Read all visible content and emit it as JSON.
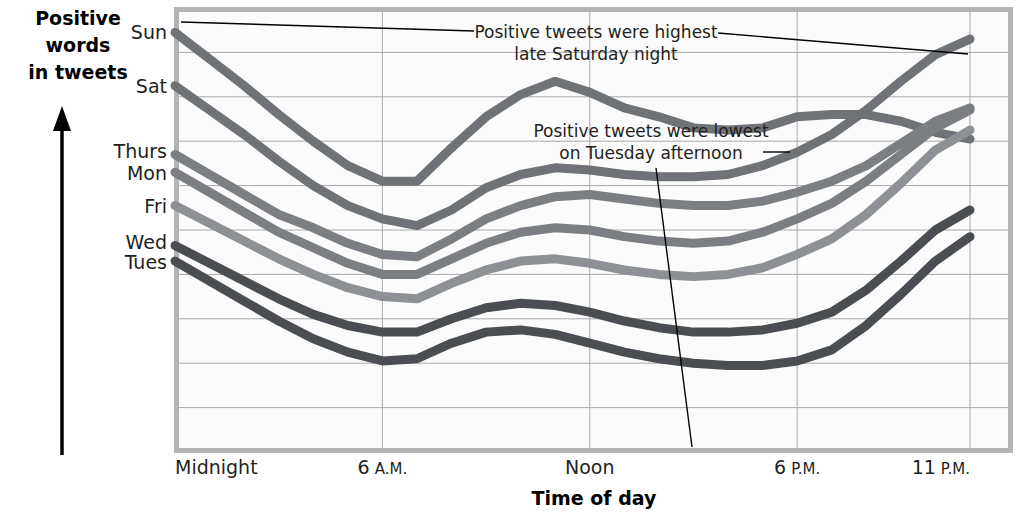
{
  "axes": {
    "y_title_lines": [
      "Positive",
      "words",
      "in tweets"
    ],
    "x_title": "Time of day",
    "y_tick_labels": [
      "Sun",
      "Sat",
      "Thurs",
      "Mon",
      "Fri",
      "Wed",
      "Tues"
    ],
    "x_tick_labels": [
      {
        "main": "Midnight",
        "suffix": ""
      },
      {
        "main": "6",
        "suffix": "A.M."
      },
      {
        "main": "Noon",
        "suffix": ""
      },
      {
        "main": "6",
        "suffix": "P.M."
      },
      {
        "main": "11",
        "suffix": "P.M."
      }
    ]
  },
  "annotations": [
    {
      "id": "highest",
      "lines": [
        "Positive tweets were highest",
        "late Saturday night"
      ]
    },
    {
      "id": "lowest",
      "lines": [
        "Positive tweets were lowest",
        "on Tuesday afternoon"
      ]
    }
  ],
  "chart_data": {
    "type": "line",
    "title": "",
    "xlabel": "Time of day",
    "ylabel": "Positive words in tweets",
    "grid": true,
    "legend": "left-axis-inline-day-labels",
    "xlim": [
      0,
      23
    ],
    "ylim": [
      0,
      10
    ],
    "xtick_values": [
      0,
      6,
      12,
      18,
      23
    ],
    "xtick_labels": [
      "Midnight",
      "6 A.M.",
      "Noon",
      "6 P.M.",
      "11 P.M."
    ],
    "x": [
      0,
      1,
      2,
      3,
      4,
      5,
      6,
      7,
      8,
      9,
      10,
      11,
      12,
      13,
      14,
      15,
      16,
      17,
      18,
      19,
      20,
      21,
      22,
      23
    ],
    "series": [
      {
        "name": "Sun",
        "color": "#6f7276",
        "values": [
          9.45,
          8.85,
          8.25,
          7.6,
          7.0,
          6.45,
          6.1,
          6.1,
          6.85,
          7.55,
          8.05,
          8.35,
          8.1,
          7.75,
          7.55,
          7.3,
          7.25,
          7.3,
          7.55,
          7.6,
          7.6,
          7.45,
          7.2,
          7.05
        ]
      },
      {
        "name": "Sat",
        "color": "#6f7276",
        "values": [
          8.25,
          7.7,
          7.15,
          6.55,
          6.0,
          5.55,
          5.25,
          5.1,
          5.45,
          5.95,
          6.25,
          6.4,
          6.35,
          6.25,
          6.2,
          6.2,
          6.25,
          6.45,
          6.75,
          7.15,
          7.7,
          8.35,
          8.95,
          9.3
        ]
      },
      {
        "name": "Thurs",
        "color": "#7b7e82",
        "values": [
          6.7,
          6.25,
          5.8,
          5.35,
          5.05,
          4.7,
          4.45,
          4.4,
          4.8,
          5.25,
          5.55,
          5.75,
          5.8,
          5.7,
          5.6,
          5.55,
          5.55,
          5.65,
          5.85,
          6.1,
          6.45,
          6.95,
          7.45,
          7.75
        ]
      },
      {
        "name": "Mon",
        "color": "#7b7e82",
        "values": [
          6.3,
          5.85,
          5.4,
          4.95,
          4.6,
          4.25,
          4.0,
          4.0,
          4.35,
          4.7,
          4.95,
          5.05,
          5.0,
          4.85,
          4.75,
          4.7,
          4.75,
          4.95,
          5.25,
          5.6,
          6.1,
          6.7,
          7.3,
          7.7
        ]
      },
      {
        "name": "Fri",
        "color": "#8d9094",
        "values": [
          5.55,
          5.15,
          4.75,
          4.35,
          4.0,
          3.7,
          3.5,
          3.45,
          3.8,
          4.1,
          4.3,
          4.35,
          4.25,
          4.1,
          4.0,
          3.95,
          4.0,
          4.15,
          4.45,
          4.8,
          5.35,
          6.05,
          6.8,
          7.25
        ]
      },
      {
        "name": "Wed",
        "color": "#4a4d51",
        "values": [
          4.65,
          4.25,
          3.85,
          3.45,
          3.1,
          2.85,
          2.7,
          2.7,
          3.0,
          3.25,
          3.35,
          3.3,
          3.15,
          2.95,
          2.8,
          2.7,
          2.7,
          2.75,
          2.9,
          3.15,
          3.65,
          4.3,
          5.0,
          5.45
        ]
      },
      {
        "name": "Tues",
        "color": "#4a4d51",
        "values": [
          4.3,
          3.85,
          3.4,
          2.95,
          2.55,
          2.25,
          2.05,
          2.1,
          2.45,
          2.7,
          2.75,
          2.65,
          2.45,
          2.25,
          2.1,
          2.0,
          1.95,
          1.95,
          2.05,
          2.3,
          2.85,
          3.55,
          4.3,
          4.85
        ]
      }
    ],
    "annotations": [
      {
        "text": "Positive tweets were highest late Saturday night",
        "points_to": {
          "x": 23,
          "y": 9.3
        }
      },
      {
        "text": "Positive tweets were lowest on Tuesday afternoon",
        "points_to": {
          "x": 16,
          "y": 1.95
        }
      }
    ]
  }
}
